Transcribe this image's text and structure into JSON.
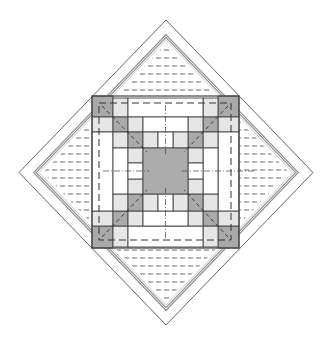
{
  "caption_fragment": "",
  "colors": {
    "background": "#ffffff",
    "outline": "#555555",
    "outer_border": "#9a9a9a",
    "double_border": "#8c8c8c",
    "dark_fill": "#a9a9a9",
    "center_fill": "#acacac",
    "light_fill": "#e6e6e6",
    "white_fill": "#ffffff",
    "grid_line": "#444444",
    "dash_line": "#555555"
  },
  "diamond": {
    "outer": {
      "top": [
        165,
        20
      ],
      "right": [
        313,
        172
      ],
      "bottom": [
        166,
        325
      ],
      "left": [
        19,
        172
      ]
    },
    "inner_double": {
      "inset": 16
    }
  },
  "block": {
    "x": 92,
    "y": 96,
    "w": 147,
    "h": 152,
    "cells": [
      {
        "x": 92,
        "y": 96,
        "w": 21,
        "h": 21,
        "fill": "dark_fill",
        "name": "corner-top-left"
      },
      {
        "x": 218,
        "y": 96,
        "w": 21,
        "h": 21,
        "fill": "dark_fill",
        "name": "corner-top-right"
      },
      {
        "x": 92,
        "y": 226,
        "w": 21,
        "h": 22,
        "fill": "dark_fill",
        "name": "corner-bottom-left"
      },
      {
        "x": 218,
        "y": 226,
        "w": 21,
        "h": 22,
        "fill": "dark_fill",
        "name": "corner-bottom-right"
      },
      {
        "x": 113,
        "y": 98,
        "w": 15,
        "h": 19,
        "fill": "light_fill",
        "name": "strip-top-left"
      },
      {
        "x": 203,
        "y": 98,
        "w": 15,
        "h": 19,
        "fill": "light_fill",
        "name": "strip-top-right"
      },
      {
        "x": 128,
        "y": 98,
        "w": 75,
        "h": 19,
        "fill": "white_fill",
        "name": "bar-top"
      },
      {
        "x": 113,
        "y": 226,
        "w": 15,
        "h": 21,
        "fill": "light_fill",
        "name": "strip-bottom-left"
      },
      {
        "x": 203,
        "y": 226,
        "w": 15,
        "h": 21,
        "fill": "light_fill",
        "name": "strip-bottom-right"
      },
      {
        "x": 128,
        "y": 226,
        "w": 75,
        "h": 21,
        "fill": "white_fill",
        "name": "bar-bottom"
      },
      {
        "x": 92,
        "y": 117,
        "w": 21,
        "h": 15,
        "fill": "light_fill",
        "name": "strip-left-top"
      },
      {
        "x": 92,
        "y": 211,
        "w": 21,
        "h": 15,
        "fill": "light_fill",
        "name": "strip-left-bottom"
      },
      {
        "x": 92,
        "y": 132,
        "w": 21,
        "h": 79,
        "fill": "white_fill",
        "name": "bar-left"
      },
      {
        "x": 218,
        "y": 117,
        "w": 21,
        "h": 15,
        "fill": "light_fill",
        "name": "strip-right-top"
      },
      {
        "x": 218,
        "y": 211,
        "w": 21,
        "h": 15,
        "fill": "light_fill",
        "name": "strip-right-bottom"
      },
      {
        "x": 218,
        "y": 132,
        "w": 21,
        "h": 79,
        "fill": "white_fill",
        "name": "bar-right"
      },
      {
        "x": 113,
        "y": 117,
        "w": 15,
        "h": 15,
        "fill": "dark_fill",
        "name": "ring2-corner-tl"
      },
      {
        "x": 203,
        "y": 117,
        "w": 15,
        "h": 15,
        "fill": "dark_fill",
        "name": "ring2-corner-tr"
      },
      {
        "x": 113,
        "y": 211,
        "w": 15,
        "h": 15,
        "fill": "dark_fill",
        "name": "ring2-corner-bl"
      },
      {
        "x": 203,
        "y": 211,
        "w": 15,
        "h": 15,
        "fill": "dark_fill",
        "name": "ring2-corner-br"
      },
      {
        "x": 128,
        "y": 117,
        "w": 15,
        "h": 15,
        "fill": "light_fill",
        "name": "ring2-top-l"
      },
      {
        "x": 188,
        "y": 117,
        "w": 15,
        "h": 15,
        "fill": "light_fill",
        "name": "ring2-top-r"
      },
      {
        "x": 143,
        "y": 117,
        "w": 45,
        "h": 15,
        "fill": "white_fill",
        "name": "ring2-top-bar"
      },
      {
        "x": 128,
        "y": 211,
        "w": 15,
        "h": 15,
        "fill": "light_fill",
        "name": "ring2-bottom-l"
      },
      {
        "x": 188,
        "y": 211,
        "w": 15,
        "h": 15,
        "fill": "light_fill",
        "name": "ring2-bottom-r"
      },
      {
        "x": 143,
        "y": 211,
        "w": 45,
        "h": 15,
        "fill": "white_fill",
        "name": "ring2-bottom-bar"
      },
      {
        "x": 113,
        "y": 132,
        "w": 15,
        "h": 16,
        "fill": "light_fill",
        "name": "ring2-left-t"
      },
      {
        "x": 113,
        "y": 194,
        "w": 15,
        "h": 17,
        "fill": "light_fill",
        "name": "ring2-left-b"
      },
      {
        "x": 113,
        "y": 148,
        "w": 15,
        "h": 46,
        "fill": "white_fill",
        "name": "ring2-left-bar"
      },
      {
        "x": 203,
        "y": 132,
        "w": 15,
        "h": 16,
        "fill": "light_fill",
        "name": "ring2-right-t"
      },
      {
        "x": 203,
        "y": 194,
        "w": 15,
        "h": 17,
        "fill": "light_fill",
        "name": "ring2-right-b"
      },
      {
        "x": 203,
        "y": 148,
        "w": 15,
        "h": 46,
        "fill": "white_fill",
        "name": "ring2-right-bar"
      },
      {
        "x": 128,
        "y": 132,
        "w": 15,
        "h": 16,
        "fill": "dark_fill",
        "name": "ring3-corner-tl"
      },
      {
        "x": 188,
        "y": 132,
        "w": 15,
        "h": 16,
        "fill": "dark_fill",
        "name": "ring3-corner-tr"
      },
      {
        "x": 128,
        "y": 194,
        "w": 15,
        "h": 17,
        "fill": "dark_fill",
        "name": "ring3-corner-bl"
      },
      {
        "x": 188,
        "y": 194,
        "w": 15,
        "h": 17,
        "fill": "dark_fill",
        "name": "ring3-corner-br"
      },
      {
        "x": 143,
        "y": 132,
        "w": 15,
        "h": 16,
        "fill": "light_fill",
        "name": "ring3-top-l"
      },
      {
        "x": 173,
        "y": 132,
        "w": 15,
        "h": 16,
        "fill": "light_fill",
        "name": "ring3-top-r"
      },
      {
        "x": 158,
        "y": 132,
        "w": 15,
        "h": 16,
        "fill": "white_fill",
        "name": "ring3-top-mid"
      },
      {
        "x": 143,
        "y": 194,
        "w": 15,
        "h": 17,
        "fill": "light_fill",
        "name": "ring3-bottom-l"
      },
      {
        "x": 173,
        "y": 194,
        "w": 15,
        "h": 17,
        "fill": "light_fill",
        "name": "ring3-bottom-r"
      },
      {
        "x": 158,
        "y": 194,
        "w": 15,
        "h": 17,
        "fill": "white_fill",
        "name": "ring3-bottom-mid"
      },
      {
        "x": 128,
        "y": 148,
        "w": 15,
        "h": 15,
        "fill": "light_fill",
        "name": "ring3-left-t"
      },
      {
        "x": 128,
        "y": 179,
        "w": 15,
        "h": 15,
        "fill": "light_fill",
        "name": "ring3-left-b"
      },
      {
        "x": 128,
        "y": 163,
        "w": 15,
        "h": 16,
        "fill": "white_fill",
        "name": "ring3-left-mid"
      },
      {
        "x": 188,
        "y": 148,
        "w": 15,
        "h": 15,
        "fill": "light_fill",
        "name": "ring3-right-t"
      },
      {
        "x": 188,
        "y": 179,
        "w": 15,
        "h": 15,
        "fill": "light_fill",
        "name": "ring3-right-b"
      },
      {
        "x": 188,
        "y": 163,
        "w": 15,
        "h": 16,
        "fill": "white_fill",
        "name": "ring3-right-mid"
      },
      {
        "x": 143,
        "y": 148,
        "w": 45,
        "h": 46,
        "fill": "center_fill",
        "name": "center-square"
      }
    ],
    "dashed_frame": {
      "x": 99,
      "y": 103,
      "w": 132,
      "h": 137
    }
  },
  "hatch": {
    "spacing": 8
  }
}
